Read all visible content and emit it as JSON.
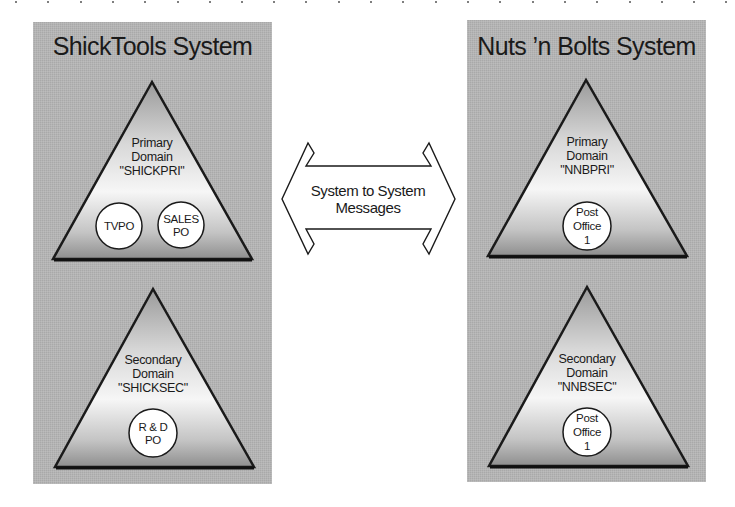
{
  "colors": {
    "panel_bg": "#b3b3b3",
    "triangle_top": "#9a9a9a",
    "triangle_mid": "#f4f4f4",
    "triangle_bottom": "#8e8e8e",
    "outline": "#1a1a1a",
    "circle_fill": "#ffffff"
  },
  "left_system": {
    "title": "ShickTools System",
    "primary": {
      "line1": "Primary",
      "line2": "Domain",
      "line3": "\"SHICKPRI\"",
      "post_offices": [
        {
          "lines": [
            "TVPO"
          ]
        },
        {
          "lines": [
            "SALES",
            "PO"
          ]
        }
      ]
    },
    "secondary": {
      "line1": "Secondary",
      "line2": "Domain",
      "line3": "\"SHICKSEC\"",
      "post_offices": [
        {
          "lines": [
            "R & D",
            "PO"
          ]
        }
      ]
    }
  },
  "right_system": {
    "title": "Nuts ’n Bolts System",
    "primary": {
      "line1": "Primary",
      "line2": "Domain",
      "line3": "\"NNBPRI\"",
      "post_offices": [
        {
          "lines": [
            "Post",
            "Office",
            "1"
          ]
        }
      ]
    },
    "secondary": {
      "line1": "Secondary",
      "line2": "Domain",
      "line3": "\"NNBSEC\"",
      "post_offices": [
        {
          "lines": [
            "Post",
            "Office",
            "1"
          ]
        }
      ]
    }
  },
  "connector": {
    "line1": "System to System",
    "line2": "Messages"
  }
}
